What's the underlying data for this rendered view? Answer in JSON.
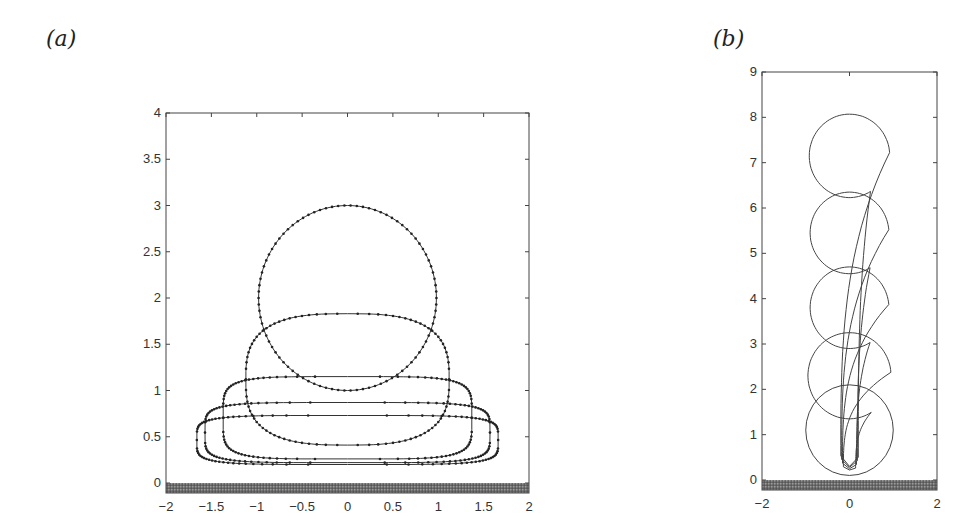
{
  "panels": {
    "a": {
      "label": "(a)"
    },
    "b": {
      "label": "(b)"
    }
  },
  "chart_data": [
    {
      "panel": "(a)",
      "type": "line",
      "title": "",
      "xlabel": "",
      "ylabel": "",
      "xlim": [
        -2,
        2
      ],
      "ylim": [
        0,
        4
      ],
      "xticks": [
        "-2",
        "-1.5",
        "-1",
        "-0.5",
        "0",
        "0.5",
        "1",
        "1.5",
        "2"
      ],
      "yticks": [
        "0",
        "0.5",
        "1",
        "1.5",
        "2",
        "2.5",
        "3",
        "3.5",
        "4"
      ],
      "grid": false,
      "legend": null,
      "ground": "hatched wall at y=0",
      "markers": "dots along each curve",
      "series": [
        {
          "name": "shape 1 (sphere)",
          "center_x": 0,
          "center_y": 2.0,
          "half_width": 0.98,
          "top": 3.0,
          "bottom": 1.0
        },
        {
          "name": "shape 2",
          "center_x": 0,
          "center_y": 1.12,
          "half_width": 1.12,
          "top": 1.83,
          "bottom": 0.41
        },
        {
          "name": "shape 3",
          "center_x": 0,
          "center_y": 0.67,
          "half_width": 1.37,
          "top": 1.15,
          "bottom": 0.26
        },
        {
          "name": "shape 4",
          "center_x": 0,
          "center_y": 0.53,
          "half_width": 1.57,
          "top": 0.87,
          "bottom": 0.22
        },
        {
          "name": "shape 5",
          "center_x": 0,
          "center_y": 0.46,
          "half_width": 1.66,
          "top": 0.73,
          "bottom": 0.2
        }
      ]
    },
    {
      "panel": "(b)",
      "type": "line",
      "title": "",
      "xlabel": "",
      "ylabel": "",
      "xlim": [
        -2,
        2
      ],
      "ylim": [
        0,
        9
      ],
      "xticks": [
        "-2",
        "0",
        "2"
      ],
      "yticks": [
        "0",
        "1",
        "2",
        "3",
        "4",
        "5",
        "6",
        "7",
        "8",
        "9"
      ],
      "grid": false,
      "legend": null,
      "ground": "hatched wall at y=0",
      "series": [
        {
          "name": "drop 1 (lowest)",
          "center_y": 1.1,
          "radius": 1.0,
          "tail_top": null
        },
        {
          "name": "drop 2",
          "center_y": 2.3,
          "radius": 0.95,
          "tail_bottom": 0.22
        },
        {
          "name": "drop 3",
          "center_y": 3.8,
          "radius": 0.9,
          "tail_bottom": 0.25
        },
        {
          "name": "drop 4",
          "center_y": 5.45,
          "radius": 0.9,
          "tail_bottom": 0.28
        },
        {
          "name": "drop 5 (highest)",
          "center_y": 7.15,
          "radius": 0.92,
          "tail_bottom": 0.3
        }
      ]
    }
  ]
}
